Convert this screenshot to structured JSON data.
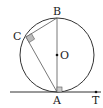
{
  "diagram": {
    "type": "geometry",
    "labels": {
      "B": "B",
      "C": "C",
      "O": "O",
      "A": "A",
      "T": "T"
    },
    "points": {
      "O": [
        57,
        55
      ],
      "A": [
        57,
        92
      ],
      "B": [
        57,
        18
      ],
      "C": [
        26,
        37
      ],
      "T": [
        96,
        92
      ]
    },
    "circle": {
      "center": "O",
      "radius": 37
    },
    "segments": [
      "AB",
      "BC",
      "CA"
    ],
    "tangent_line": {
      "through": "A",
      "direction": "horizontal",
      "marked_point": "T"
    },
    "right_angles": [
      "C (angle BCA)",
      "A (angle BAT)"
    ],
    "colors": {
      "stroke": "#333333",
      "marker_fill": "#bbbbbb"
    }
  }
}
